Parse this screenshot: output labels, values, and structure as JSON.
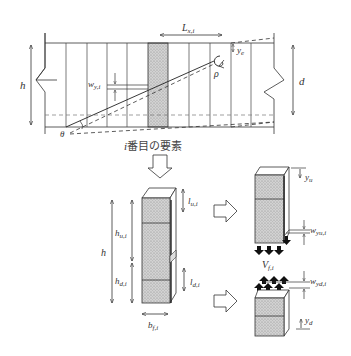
{
  "beam": {
    "label_L": "L",
    "label_L_sub": "x,i",
    "label_h": "h",
    "label_d": "d",
    "label_w": "w",
    "label_w_sub": "y,i",
    "label_theta": "θ",
    "label_rho": "ρ",
    "label_ye": "y",
    "label_ye_sub": "e",
    "element_caption": "番目の要素",
    "element_caption_i": "i"
  },
  "element": {
    "label_h": "h",
    "label_hu": "h",
    "label_hu_sub": "u,i",
    "label_hd": "h",
    "label_hd_sub": "d,i",
    "label_lu": "l",
    "label_lu_sub": "u,i",
    "label_ld": "l",
    "label_ld_sub": "d,i",
    "label_bf": "b",
    "label_bf_sub": "f,i"
  },
  "upper_part": {
    "label_yu": "y",
    "label_yu_sub": "u",
    "label_wyu": "w",
    "label_wyu_sub": "yu,i"
  },
  "force": {
    "label_V": "V",
    "label_V_sub": "f,i"
  },
  "lower_part": {
    "label_yd": "y",
    "label_yd_sub": "d",
    "label_wyd": "w",
    "label_wyd_sub": "yd,i"
  },
  "colors": {
    "line": "#333333",
    "hatch_bg": "#c8c8c8",
    "dash": "#555555"
  }
}
